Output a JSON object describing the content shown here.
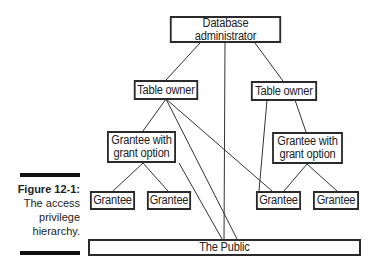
{
  "diagram": {
    "nodes": {
      "dba": "Database administrator",
      "owner_left": "Table owner",
      "owner_right": "Table owner",
      "grant_left_line1": "Grantee with",
      "grant_left_line2": "grant option",
      "grant_right_line1": "Grantee with",
      "grant_right_line2": "grant option",
      "grantee_1": "Grantee",
      "grantee_2": "Grantee",
      "grantee_3": "Grantee",
      "grantee_4": "Grantee",
      "public": "The Public"
    },
    "edges": [
      [
        "dba",
        "owner_left"
      ],
      [
        "dba",
        "owner_right"
      ],
      [
        "dba",
        "public"
      ],
      [
        "owner_left",
        "grant_left"
      ],
      [
        "owner_left",
        "public"
      ],
      [
        "owner_left",
        "grantee_3"
      ],
      [
        "owner_right",
        "grant_right"
      ],
      [
        "owner_right",
        "grantee_3"
      ],
      [
        "grant_left",
        "grantee_1"
      ],
      [
        "grant_left",
        "grantee_2"
      ],
      [
        "grant_left",
        "public"
      ],
      [
        "grant_right",
        "grantee_3"
      ],
      [
        "grant_right",
        "grantee_4"
      ]
    ]
  },
  "caption": {
    "label": "Figure 12-1:",
    "line1": "The access",
    "line2": "privilege",
    "line3": "hierarchy."
  }
}
